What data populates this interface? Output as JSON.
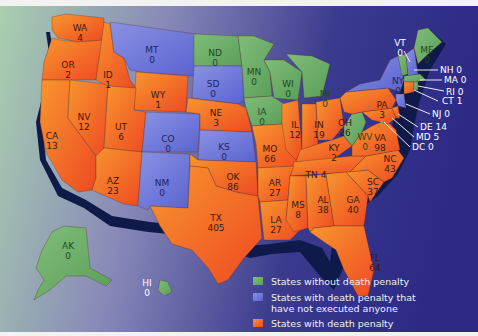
{
  "colors": {
    "no_penalty": "#6fae6a",
    "no_executions": "#6f78d8",
    "with_penalty": "#f0602a",
    "with_penalty_light": "#f7922f",
    "coast": "#101a4a",
    "ocean_left": "#a9cfae",
    "ocean_mid": "#8788b8",
    "ocean_right": "#2c2a86",
    "callout_text": "#ffffff"
  },
  "legend": {
    "items": [
      {
        "key": "no_penalty",
        "label_line1": "States without death penalty",
        "label_line2": ""
      },
      {
        "key": "no_executions",
        "label_line1": "States with death penalty that",
        "label_line2": "have not executed anyone"
      },
      {
        "key": "with_penalty",
        "label_line1": "States with death penalty",
        "label_line2": ""
      }
    ]
  },
  "states": {
    "WA": {
      "abbr": "WA",
      "value": "4",
      "category": "with_penalty"
    },
    "OR": {
      "abbr": "OR",
      "value": "2",
      "category": "with_penalty"
    },
    "ID": {
      "abbr": "ID",
      "value": "1",
      "category": "with_penalty"
    },
    "MT": {
      "abbr": "MT",
      "value": "0",
      "category": "no_executions"
    },
    "WY": {
      "abbr": "WY",
      "value": "1",
      "category": "with_penalty"
    },
    "ND": {
      "abbr": "ND",
      "value": "0",
      "category": "no_penalty"
    },
    "SD": {
      "abbr": "SD",
      "value": "0",
      "category": "no_executions"
    },
    "NE": {
      "abbr": "NE",
      "value": "3",
      "category": "with_penalty"
    },
    "MN": {
      "abbr": "MN",
      "value": "0",
      "category": "no_penalty"
    },
    "IA": {
      "abbr": "IA",
      "value": "0",
      "category": "no_penalty"
    },
    "WI": {
      "abbr": "WI",
      "value": "0",
      "category": "no_penalty"
    },
    "MI": {
      "abbr": "MI",
      "value": "0",
      "category": "no_penalty"
    },
    "CA": {
      "abbr": "CA",
      "value": "13",
      "category": "with_penalty"
    },
    "NV": {
      "abbr": "NV",
      "value": "12",
      "category": "with_penalty"
    },
    "UT": {
      "abbr": "UT",
      "value": "6",
      "category": "with_penalty"
    },
    "CO": {
      "abbr": "CO",
      "value": "0",
      "category": "no_executions"
    },
    "AZ": {
      "abbr": "AZ",
      "value": "23",
      "category": "with_penalty"
    },
    "NM": {
      "abbr": "NM",
      "value": "0",
      "category": "no_executions"
    },
    "KS": {
      "abbr": "KS",
      "value": "0",
      "category": "no_executions"
    },
    "OK": {
      "abbr": "OK",
      "value": "86",
      "category": "with_penalty"
    },
    "TX": {
      "abbr": "TX",
      "value": "405",
      "category": "with_penalty"
    },
    "MO": {
      "abbr": "MO",
      "value": "66",
      "category": "with_penalty"
    },
    "AR": {
      "abbr": "AR",
      "value": "27",
      "category": "with_penalty"
    },
    "LA": {
      "abbr": "LA",
      "value": "27",
      "category": "with_penalty"
    },
    "IL": {
      "abbr": "IL",
      "value": "12",
      "category": "with_penalty"
    },
    "IN": {
      "abbr": "IN",
      "value": "19",
      "category": "with_penalty"
    },
    "OH": {
      "abbr": "OH",
      "value": "26",
      "category": "with_penalty"
    },
    "KY": {
      "abbr": "KY",
      "value": "2",
      "category": "with_penalty"
    },
    "TN": {
      "abbr": "TN",
      "value": "4",
      "category": "with_penalty"
    },
    "MS": {
      "abbr": "MS",
      "value": "8",
      "category": "with_penalty"
    },
    "AL": {
      "abbr": "AL",
      "value": "38",
      "category": "with_penalty"
    },
    "GA": {
      "abbr": "GA",
      "value": "40",
      "category": "with_penalty"
    },
    "FL": {
      "abbr": "FL",
      "value": "64",
      "category": "with_penalty"
    },
    "SC": {
      "abbr": "SC",
      "value": "37",
      "category": "with_penalty"
    },
    "NC": {
      "abbr": "NC",
      "value": "43",
      "category": "with_penalty"
    },
    "VA": {
      "abbr": "VA",
      "value": "98",
      "category": "with_penalty"
    },
    "WV": {
      "abbr": "WV",
      "value": "0",
      "category": "no_penalty"
    },
    "PA": {
      "abbr": "PA",
      "value": "3",
      "category": "with_penalty"
    },
    "NY": {
      "abbr": "NY",
      "value": "0",
      "category": "no_executions"
    },
    "VT": {
      "abbr": "VT",
      "value": "0",
      "category": "no_penalty"
    },
    "ME": {
      "abbr": "ME",
      "value": "0",
      "category": "no_penalty"
    },
    "NH": {
      "abbr": "NH",
      "value": "0",
      "category": "no_executions"
    },
    "MA": {
      "abbr": "MA",
      "value": "0",
      "category": "no_penalty"
    },
    "RI": {
      "abbr": "RI",
      "value": "0",
      "category": "no_penalty"
    },
    "CT": {
      "abbr": "CT",
      "value": "1",
      "category": "with_penalty"
    },
    "NJ": {
      "abbr": "NJ",
      "value": "0",
      "category": "no_executions"
    },
    "DE": {
      "abbr": "DE",
      "value": "14",
      "category": "with_penalty"
    },
    "MD": {
      "abbr": "MD",
      "value": "5",
      "category": "with_penalty"
    },
    "DC": {
      "abbr": "DC",
      "value": "0",
      "category": "no_penalty"
    },
    "AK": {
      "abbr": "AK",
      "value": "0",
      "category": "no_penalty"
    },
    "HI": {
      "abbr": "HI",
      "value": "0",
      "category": "no_penalty"
    }
  },
  "callouts": {
    "NH": "NH 0",
    "MA": "MA 0",
    "RI": "RI 0",
    "CT": "CT 1",
    "NJ": "NJ 0",
    "DE": "DE 14",
    "MD": "MD 5",
    "DC": "DC 0"
  }
}
